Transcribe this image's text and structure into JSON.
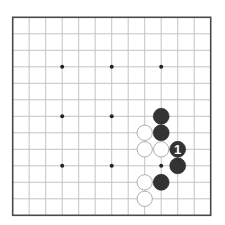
{
  "board": {
    "size": 13,
    "origin_x": 12.7,
    "origin_y": 17.3,
    "spacing": 16.5,
    "colors": {
      "background": "#ffffff",
      "grid": "#c4c4c4",
      "border": "#4a4a4a",
      "star": "#222222",
      "black_stone": "#333333",
      "white_stone": "#ffffff",
      "white_stone_outline": "#9a9a9a",
      "label_on_black": "#ffffff"
    },
    "star_points": [
      {
        "col": 3,
        "row": 3
      },
      {
        "col": 6,
        "row": 3
      },
      {
        "col": 9,
        "row": 3
      },
      {
        "col": 3,
        "row": 6
      },
      {
        "col": 6,
        "row": 6
      },
      {
        "col": 3,
        "row": 9
      },
      {
        "col": 6,
        "row": 9
      },
      {
        "col": 9,
        "row": 9
      }
    ],
    "stones": [
      {
        "color": "black",
        "col": 9,
        "row": 6,
        "label": ""
      },
      {
        "color": "white",
        "col": 8,
        "row": 7,
        "label": ""
      },
      {
        "color": "black",
        "col": 9,
        "row": 7,
        "label": ""
      },
      {
        "color": "white",
        "col": 8,
        "row": 8,
        "label": ""
      },
      {
        "color": "white",
        "col": 9,
        "row": 8,
        "label": ""
      },
      {
        "color": "black",
        "col": 10,
        "row": 8,
        "label": "1"
      },
      {
        "color": "black",
        "col": 10,
        "row": 9,
        "label": ""
      },
      {
        "color": "white",
        "col": 8,
        "row": 10,
        "label": ""
      },
      {
        "color": "black",
        "col": 9,
        "row": 10,
        "label": ""
      },
      {
        "color": "white",
        "col": 8,
        "row": 11,
        "label": ""
      }
    ]
  }
}
